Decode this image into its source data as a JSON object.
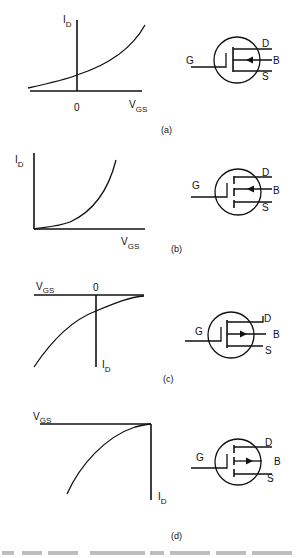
{
  "figure": {
    "panels": [
      {
        "id": "a",
        "caption": "(a)",
        "graph": {
          "y_label_main": "I",
          "y_label_sub": "D",
          "x_label_main": "V",
          "x_label_sub": "GS",
          "origin_label": "0",
          "description": "Depletion-mode n-channel: I_D grows with V_GS, nonzero at V_GS = 0"
        },
        "symbol": {
          "gate": "G",
          "drain": "D",
          "body": "B",
          "source": "S",
          "channel": "solid",
          "arrow": "inward (n-channel)"
        }
      },
      {
        "id": "b",
        "caption": "(b)",
        "graph": {
          "y_label_main": "I",
          "y_label_sub": "D",
          "x_label_main": "V",
          "x_label_sub": "GS",
          "description": "Enhancement-mode n-channel: I_D rises from threshold"
        },
        "symbol": {
          "gate": "G",
          "drain": "D",
          "body": "B",
          "source": "S",
          "channel": "broken",
          "arrow": "inward (n-channel)"
        }
      },
      {
        "id": "c",
        "caption": "(c)",
        "graph": {
          "y_label_main": "I",
          "y_label_sub": "D",
          "x_label_main": "V",
          "x_label_sub": "GS",
          "origin_label": "0",
          "description": "Depletion-mode p-channel: inverted axes"
        },
        "symbol": {
          "gate": "G",
          "drain": "D",
          "body": "B",
          "source": "S",
          "channel": "solid",
          "arrow": "outward (p-channel)"
        }
      },
      {
        "id": "d",
        "caption": "(d)",
        "graph": {
          "y_label_main": "I",
          "y_label_sub": "D",
          "x_label_main": "V",
          "x_label_sub": "GS",
          "description": "Enhancement-mode p-channel: inverted axes"
        },
        "symbol": {
          "gate": "G",
          "drain": "D",
          "body": "B",
          "source": "S",
          "channel": "broken",
          "arrow": "outward (p-channel)"
        }
      }
    ]
  }
}
